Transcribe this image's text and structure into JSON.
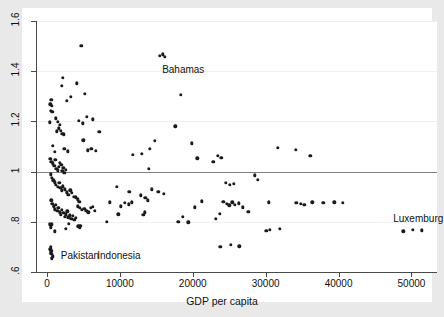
{
  "chart_data": {
    "type": "scatter",
    "title": "",
    "xlabel": "GDP per capita",
    "ylabel": "",
    "xlim": [
      -1500,
      53500
    ],
    "ylim": [
      0.6,
      1.6
    ],
    "grid": true,
    "legend": null,
    "xticks": [
      0,
      10000,
      20000,
      30000,
      40000,
      50000
    ],
    "xticklabels": [
      "0",
      "10000",
      "20000",
      "30000",
      "40000",
      "50000"
    ],
    "yticks": [
      0.6,
      0.8,
      1.0,
      1.2,
      1.4,
      1.6
    ],
    "yticklabels": [
      ".6",
      ".8",
      "1",
      "1.2",
      "1.4",
      "1.6"
    ],
    "reference_line": {
      "y": 1.0,
      "color": "#808080"
    },
    "marker": {
      "shape": "circle",
      "color": "#1a1a1a",
      "size": 3.4
    },
    "annotations": [
      {
        "text": "Bahamas",
        "x": 15800,
        "y": 1.405
      },
      {
        "text": "Pakistan",
        "x": 1900,
        "y": 0.663
      },
      {
        "text": "Indonesia",
        "x": 6900,
        "y": 0.663
      },
      {
        "text": "Luxemburg",
        "x": 47500,
        "y": 0.812
      }
    ],
    "points": [
      [
        600,
        1.285
      ],
      [
        700,
        1.262
      ],
      [
        480,
        1.268
      ],
      [
        520,
        1.243
      ],
      [
        760,
        1.238
      ],
      [
        430,
        1.197
      ],
      [
        2150,
        1.373
      ],
      [
        2000,
        1.343
      ],
      [
        4100,
        1.352
      ],
      [
        4700,
        1.5
      ],
      [
        3250,
        1.297
      ],
      [
        5200,
        1.311
      ],
      [
        2700,
        1.282
      ],
      [
        4400,
        1.203
      ],
      [
        4900,
        1.192
      ],
      [
        5500,
        1.218
      ],
      [
        6300,
        1.208
      ],
      [
        1200,
        1.213
      ],
      [
        1500,
        1.198
      ],
      [
        1750,
        1.186
      ],
      [
        1900,
        1.163
      ],
      [
        2100,
        1.15
      ],
      [
        2350,
        1.148
      ],
      [
        1600,
        1.172
      ],
      [
        1350,
        1.16
      ],
      [
        780,
        1.103
      ],
      [
        1050,
        1.078
      ],
      [
        2400,
        1.092
      ],
      [
        2900,
        1.081
      ],
      [
        5000,
        1.124
      ],
      [
        5600,
        1.085
      ],
      [
        6100,
        1.09
      ],
      [
        7200,
        1.158
      ],
      [
        6700,
        1.083
      ],
      [
        15500,
        1.462
      ],
      [
        15900,
        1.468
      ],
      [
        16200,
        1.458
      ],
      [
        18400,
        1.305
      ],
      [
        17600,
        1.18
      ],
      [
        14800,
        1.122
      ],
      [
        14100,
        1.09
      ],
      [
        13000,
        1.071
      ],
      [
        11800,
        1.068
      ],
      [
        19900,
        1.112
      ],
      [
        20600,
        1.053
      ],
      [
        22800,
        1.038
      ],
      [
        23400,
        1.062
      ],
      [
        23900,
        1.054
      ],
      [
        31700,
        1.095
      ],
      [
        34100,
        1.086
      ],
      [
        36100,
        1.062
      ],
      [
        460,
        1.052
      ],
      [
        620,
        1.04
      ],
      [
        830,
        1.033
      ],
      [
        1000,
        1.022
      ],
      [
        1150,
        1.047
      ],
      [
        1300,
        1.01
      ],
      [
        1450,
        1.005
      ],
      [
        1600,
        1.02
      ],
      [
        1800,
        1.036
      ],
      [
        1950,
        1.028
      ],
      [
        2100,
        1.002
      ],
      [
        2250,
        1.014
      ],
      [
        2400,
        0.995
      ],
      [
        2600,
        1.008
      ],
      [
        540,
        0.99
      ],
      [
        700,
        0.975
      ],
      [
        880,
        0.965
      ],
      [
        1100,
        0.958
      ],
      [
        1250,
        0.948
      ],
      [
        1500,
        0.94
      ],
      [
        1700,
        0.955
      ],
      [
        1850,
        0.935
      ],
      [
        2000,
        0.925
      ],
      [
        2200,
        0.942
      ],
      [
        2450,
        0.93
      ],
      [
        2700,
        0.918
      ],
      [
        2950,
        0.908
      ],
      [
        3200,
        0.925
      ],
      [
        3450,
        0.915
      ],
      [
        3700,
        0.9
      ],
      [
        3950,
        0.898
      ],
      [
        4200,
        0.89
      ],
      [
        4450,
        0.88
      ],
      [
        9600,
        0.94
      ],
      [
        11300,
        0.92
      ],
      [
        12900,
        0.905
      ],
      [
        13500,
        0.895
      ],
      [
        13800,
        0.885
      ],
      [
        14400,
        0.93
      ],
      [
        15300,
        0.92
      ],
      [
        16000,
        0.912
      ],
      [
        14000,
        1.01
      ],
      [
        24500,
        0.955
      ],
      [
        25100,
        0.948
      ],
      [
        25600,
        0.952
      ],
      [
        28500,
        0.985
      ],
      [
        28900,
        0.968
      ],
      [
        600,
        0.885
      ],
      [
        760,
        0.872
      ],
      [
        920,
        0.862
      ],
      [
        1080,
        0.85
      ],
      [
        1230,
        0.868
      ],
      [
        1400,
        0.845
      ],
      [
        1580,
        0.855
      ],
      [
        1750,
        0.838
      ],
      [
        1900,
        0.828
      ],
      [
        2080,
        0.848
      ],
      [
        2250,
        0.836
      ],
      [
        2420,
        0.82
      ],
      [
        2600,
        0.83
      ],
      [
        2780,
        0.842
      ],
      [
        2950,
        0.818
      ],
      [
        3150,
        0.826
      ],
      [
        3350,
        0.812
      ],
      [
        3550,
        0.824
      ],
      [
        3750,
        0.808
      ],
      [
        3950,
        0.816
      ],
      [
        4200,
        0.862
      ],
      [
        4500,
        0.856
      ],
      [
        4800,
        0.848
      ],
      [
        5100,
        0.852
      ],
      [
        5400,
        0.844
      ],
      [
        5700,
        0.838
      ],
      [
        6000,
        0.856
      ],
      [
        6300,
        0.86
      ],
      [
        6600,
        0.845
      ],
      [
        8600,
        0.878
      ],
      [
        10100,
        0.862
      ],
      [
        10700,
        0.875
      ],
      [
        11200,
        0.87
      ],
      [
        11600,
        0.878
      ],
      [
        9800,
        0.83
      ],
      [
        13200,
        0.828
      ],
      [
        13400,
        0.838
      ],
      [
        18000,
        0.8
      ],
      [
        18600,
        0.82
      ],
      [
        19400,
        0.798
      ],
      [
        20300,
        0.858
      ],
      [
        21200,
        0.882
      ],
      [
        23200,
        0.812
      ],
      [
        23700,
        0.832
      ],
      [
        24200,
        0.88
      ],
      [
        24700,
        0.872
      ],
      [
        25000,
        0.866
      ],
      [
        25400,
        0.878
      ],
      [
        25800,
        0.868
      ],
      [
        26300,
        0.874
      ],
      [
        26900,
        0.858
      ],
      [
        27600,
        0.84
      ],
      [
        30400,
        0.878
      ],
      [
        34200,
        0.876
      ],
      [
        34800,
        0.872
      ],
      [
        35300,
        0.868
      ],
      [
        36400,
        0.878
      ],
      [
        37900,
        0.876
      ],
      [
        39400,
        0.878
      ],
      [
        40600,
        0.876
      ],
      [
        30100,
        0.765
      ],
      [
        30600,
        0.768
      ],
      [
        31900,
        0.772
      ],
      [
        48900,
        0.762
      ],
      [
        50200,
        0.768
      ],
      [
        51400,
        0.766
      ],
      [
        430,
        0.79
      ],
      [
        560,
        0.778
      ],
      [
        700,
        0.79
      ],
      [
        1100,
        0.762
      ],
      [
        3000,
        0.792
      ],
      [
        4300,
        0.782
      ],
      [
        4500,
        0.778
      ],
      [
        4600,
        0.784
      ],
      [
        2600,
        0.772
      ],
      [
        8200,
        0.8
      ],
      [
        23800,
        0.7
      ],
      [
        25200,
        0.708
      ],
      [
        26400,
        0.702
      ],
      [
        460,
        0.69
      ],
      [
        500,
        0.678
      ],
      [
        600,
        0.672
      ],
      [
        700,
        0.655
      ],
      [
        820,
        0.662
      ],
      [
        560,
        0.7
      ],
      [
        640,
        0.684
      ]
    ]
  }
}
